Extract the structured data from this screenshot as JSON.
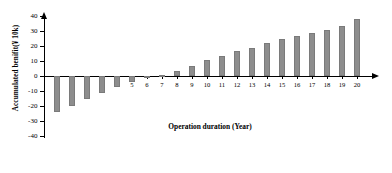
{
  "chart_data": {
    "type": "bar",
    "title": "",
    "xlabel": "Operation duration (Year)",
    "ylabel": "Accumulated benifit(¥ 10k)",
    "categories": [
      "0",
      "1",
      "2",
      "3",
      "4",
      "5",
      "6",
      "7",
      "8",
      "9",
      "10",
      "11",
      "12",
      "13",
      "14",
      "15",
      "16",
      "17",
      "18",
      "19",
      "20"
    ],
    "values": [
      -24,
      -20,
      -15,
      -11,
      -7.5,
      -4,
      -1.5,
      0.5,
      3.5,
      7,
      10.5,
      13.5,
      16.5,
      19,
      22,
      24.5,
      26.5,
      28.5,
      31,
      33.5,
      38
    ],
    "ylim": [
      -40,
      40
    ],
    "yticks": [
      40,
      30,
      20,
      10,
      0,
      -10,
      -20,
      -30,
      -40
    ],
    "ytick_labels": [
      "40",
      "30",
      "20",
      "10",
      "0",
      "-10",
      "-20",
      "-30",
      "-40"
    ],
    "xtick_labels": [
      "0",
      "1",
      "2",
      "3",
      "4",
      "5",
      "6",
      "7",
      "8",
      "9",
      "10",
      "11",
      "12",
      "13",
      "14",
      "15",
      "16",
      "17",
      "18",
      "19",
      "20"
    ],
    "grid": false,
    "legend": null,
    "bar_color": "#8d8d8d",
    "axis_color": "#000000"
  }
}
